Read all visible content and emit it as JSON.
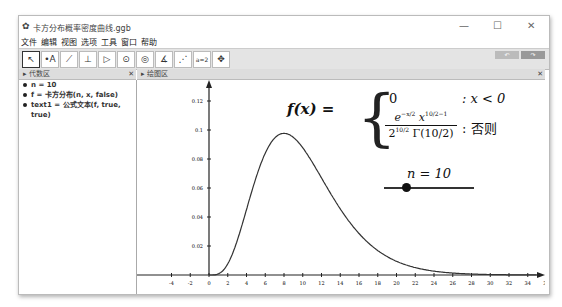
{
  "window": {
    "title": "卡方分布概率密度曲线.ggb",
    "controls": [
      "—",
      "☐",
      "✕"
    ]
  },
  "menu": [
    "文件",
    "编辑",
    "视图",
    "选项",
    "工具",
    "窗口",
    "帮助"
  ],
  "toolbar": {
    "tools": [
      "pointer",
      "point",
      "line",
      "perpendicular",
      "polygon",
      "circle",
      "conic",
      "angle",
      "reflect",
      "slider",
      "move-view"
    ],
    "glyphs": [
      "↖",
      "•A",
      "⟋",
      "⊥",
      "▷",
      "⊙",
      "◎",
      "∡",
      "⋰",
      "a=2",
      "✥"
    ],
    "undo": "↶",
    "redo": "↷"
  },
  "algebra": {
    "title": "代数区",
    "items": [
      "n = 10",
      "f = 卡方分布(n, x, false)",
      "text1 = 公式文本(f, true, true)"
    ]
  },
  "graphics": {
    "title": "绘图区"
  },
  "formula": {
    "lhs": "f(x) =",
    "case1": "0",
    "cond1": ": x < 0",
    "cond2": ": 否则",
    "slider_label": "n = 10"
  },
  "chart_data": {
    "type": "line",
    "title": "",
    "function": "chi-square pdf, n=10",
    "x_ticks": [
      -4,
      -2,
      0,
      2,
      4,
      6,
      8,
      10,
      12,
      14,
      16,
      18,
      20,
      22,
      24,
      26,
      28,
      30,
      32,
      34,
      36
    ],
    "y_ticks": [
      0.02,
      0.04,
      0.06,
      0.08,
      0.1,
      0.12
    ],
    "xlim": [
      -5,
      37
    ],
    "ylim": [
      0,
      0.13
    ],
    "peak": {
      "x": 8,
      "y": 0.0977
    }
  }
}
